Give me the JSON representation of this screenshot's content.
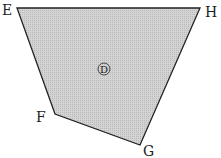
{
  "diagram": {
    "type": "quadrilateral",
    "fill_color": "#c8c8c8",
    "stroke_color": "#222222",
    "vertices": [
      {
        "name": "E",
        "x": 17,
        "y": 8
      },
      {
        "name": "H",
        "x": 200,
        "y": 8
      },
      {
        "name": "G",
        "x": 140,
        "y": 145
      },
      {
        "name": "F",
        "x": 55,
        "y": 114
      }
    ],
    "labels": {
      "E": "E",
      "H": "H",
      "F": "F",
      "G": "G",
      "region": "D"
    }
  }
}
